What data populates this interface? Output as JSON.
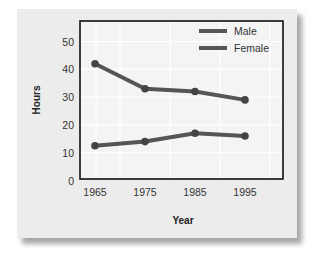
{
  "chart_data": {
    "type": "line",
    "title": "",
    "xlabel": "Year",
    "ylabel": "Hours",
    "categories": [
      "1965",
      "1975",
      "1985",
      "1995"
    ],
    "series": [
      {
        "name": "Male",
        "values": [
          42,
          33,
          32,
          29
        ],
        "color": "#555555"
      },
      {
        "name": "Female",
        "values": [
          12.5,
          14,
          17,
          16
        ],
        "color": "#555555"
      }
    ],
    "ylim": [
      0,
      55
    ],
    "yticks": [
      0,
      10,
      20,
      30,
      40,
      50
    ],
    "grid": true,
    "legend_position": "upper right",
    "markers": true
  },
  "colors": {
    "card_background": "#ececec",
    "plot_background": "#f4f4f4",
    "frame": "#111111",
    "grid": "#ffffff",
    "series_line": "#555555",
    "text": "#222222"
  }
}
